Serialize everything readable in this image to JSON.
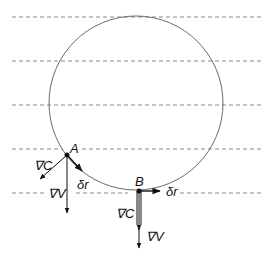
{
  "diagram": {
    "level_lines_y": [
      17,
      61,
      105,
      149,
      193
    ],
    "circle": {
      "cx": 136,
      "cy": 105,
      "r": 86
    },
    "points": {
      "A": {
        "label": "A",
        "x": 67,
        "y": 155
      },
      "B": {
        "label": "B",
        "x": 139,
        "y": 191
      }
    },
    "labels": {
      "gradC_A": "∇C",
      "gradV_A": "∇V",
      "dr_A": "δr",
      "gradC_B": "∇C",
      "gradV_B": "∇V",
      "dr_B": "δr"
    },
    "colors": {
      "dashed_line": "#8a8a8a",
      "circle": "#6a6a6a",
      "vector": "#111111"
    }
  }
}
